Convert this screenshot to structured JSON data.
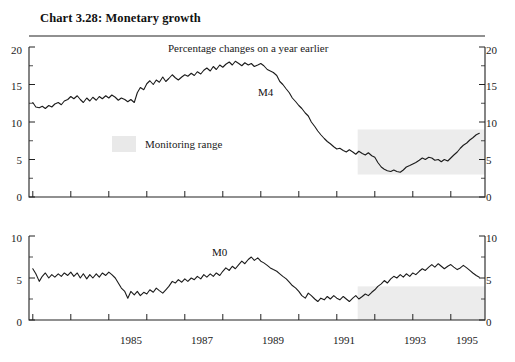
{
  "title": "Chart 3.28: Monetary growth",
  "subtitle": "Percentage changes on a year earlier",
  "legend": {
    "monitoring_range_label": "Monitoring range",
    "swatch_color": "#ececec"
  },
  "axis": {
    "x_ticks": [
      "1985",
      "1987",
      "1989",
      "1991",
      "1993",
      "1995"
    ],
    "top_y_ticks": [
      "0",
      "5",
      "10",
      "15",
      "20"
    ],
    "bottom_y_ticks": [
      "0",
      "5",
      "10"
    ]
  },
  "chart_data": [
    {
      "type": "line",
      "title": "Chart 3.28: Monetary growth",
      "subtitle": "Percentage changes on a year earlier",
      "panel": "top",
      "xlabel": "",
      "ylabel": "",
      "xlim": [
        1983.9,
        1995.9
      ],
      "ylim": [
        0,
        20
      ],
      "yticks": [
        0,
        5,
        10,
        15,
        20
      ],
      "xticks": [
        1985,
        1987,
        1989,
        1991,
        1993,
        1995
      ],
      "grid": false,
      "legend": "none",
      "annotations": [
        {
          "text": "M4",
          "x": 1989.3,
          "y": 14.2
        },
        {
          "text": "Percentage changes on a year earlier",
          "x": 1989.0,
          "y": 19.2
        },
        {
          "text": "Monitoring range",
          "x": 1987.0,
          "y": 7.6
        }
      ],
      "bands": [
        {
          "label": "Monitoring range",
          "x_start": 1992.55,
          "x_end": 1995.9,
          "y_low": 3,
          "y_high": 9,
          "color": "#ececec"
        }
      ],
      "series": [
        {
          "name": "M4",
          "x": [
            1984.0,
            1984.08,
            1984.17,
            1984.25,
            1984.33,
            1984.42,
            1984.5,
            1984.58,
            1984.67,
            1984.75,
            1984.83,
            1984.92,
            1985.0,
            1985.08,
            1985.17,
            1985.25,
            1985.33,
            1985.42,
            1985.5,
            1985.58,
            1985.67,
            1985.75,
            1985.83,
            1985.92,
            1986.0,
            1986.08,
            1986.17,
            1986.25,
            1986.33,
            1986.42,
            1986.5,
            1986.58,
            1986.67,
            1986.75,
            1986.83,
            1986.92,
            1987.0,
            1987.08,
            1987.17,
            1987.25,
            1987.33,
            1987.42,
            1987.5,
            1987.58,
            1987.67,
            1987.75,
            1987.83,
            1987.92,
            1988.0,
            1988.08,
            1988.17,
            1988.25,
            1988.33,
            1988.42,
            1988.5,
            1988.58,
            1988.67,
            1988.75,
            1988.83,
            1988.92,
            1989.0,
            1989.08,
            1989.17,
            1989.25,
            1989.33,
            1989.42,
            1989.5,
            1989.58,
            1989.67,
            1989.75,
            1989.83,
            1989.92,
            1990.0,
            1990.08,
            1990.17,
            1990.25,
            1990.33,
            1990.42,
            1990.5,
            1990.58,
            1990.67,
            1990.75,
            1990.83,
            1990.92,
            1991.0,
            1991.08,
            1991.17,
            1991.25,
            1991.33,
            1991.42,
            1991.5,
            1991.58,
            1991.67,
            1991.75,
            1991.83,
            1991.92,
            1992.0,
            1992.08,
            1992.17,
            1992.25,
            1992.33,
            1992.42,
            1992.5,
            1992.58,
            1992.67,
            1992.75,
            1992.83,
            1992.92,
            1993.0,
            1993.08,
            1993.17,
            1993.25,
            1993.33,
            1993.42,
            1993.5,
            1993.58,
            1993.67,
            1993.75,
            1993.83,
            1993.92,
            1994.0,
            1994.08,
            1994.17,
            1994.25,
            1994.33,
            1994.42,
            1994.5,
            1994.58,
            1994.67,
            1994.75,
            1994.83,
            1994.92,
            1995.0,
            1995.08,
            1995.17,
            1995.25,
            1995.33,
            1995.42,
            1995.5,
            1995.58,
            1995.67,
            1995.75
          ],
          "values": [
            12.6,
            12.0,
            11.9,
            12.1,
            11.8,
            12.2,
            12.0,
            12.4,
            12.6,
            12.3,
            12.8,
            13.0,
            13.4,
            13.1,
            13.5,
            13.0,
            12.6,
            13.2,
            12.8,
            13.3,
            12.9,
            13.4,
            13.1,
            13.5,
            13.2,
            13.6,
            13.3,
            12.9,
            13.2,
            13.0,
            12.7,
            13.0,
            12.6,
            13.9,
            14.6,
            14.3,
            15.1,
            15.5,
            15.0,
            15.6,
            15.3,
            16.0,
            15.4,
            15.8,
            16.3,
            15.9,
            15.6,
            16.0,
            16.3,
            16.1,
            16.5,
            16.2,
            16.7,
            16.4,
            16.9,
            17.2,
            16.8,
            17.4,
            17.0,
            17.6,
            17.3,
            17.7,
            18.0,
            17.6,
            18.1,
            17.8,
            17.5,
            17.9,
            17.6,
            17.8,
            17.4,
            17.6,
            17.8,
            17.5,
            17.0,
            16.8,
            16.6,
            16.2,
            15.4,
            15.0,
            14.4,
            13.9,
            13.2,
            12.7,
            12.2,
            11.8,
            11.2,
            10.8,
            10.0,
            9.4,
            8.8,
            8.3,
            7.8,
            7.4,
            7.1,
            6.7,
            6.4,
            6.5,
            6.2,
            6.0,
            6.3,
            6.0,
            5.7,
            6.1,
            5.8,
            5.6,
            5.9,
            5.5,
            5.3,
            4.6,
            4.0,
            3.7,
            3.5,
            3.4,
            3.6,
            3.4,
            3.3,
            3.6,
            4.0,
            4.2,
            4.4,
            4.6,
            4.9,
            5.2,
            5.0,
            5.3,
            5.2,
            4.9,
            5.0,
            4.7,
            5.0,
            4.8,
            5.2,
            5.6,
            6.0,
            6.5,
            6.9,
            7.2,
            7.6,
            7.9,
            8.3,
            8.5
          ]
        }
      ]
    },
    {
      "type": "line",
      "panel": "bottom",
      "xlabel": "",
      "ylabel": "",
      "xlim": [
        1983.9,
        1995.9
      ],
      "ylim": [
        0,
        10
      ],
      "yticks": [
        0,
        5,
        10
      ],
      "xticks": [
        1985,
        1987,
        1989,
        1991,
        1993,
        1995
      ],
      "grid": false,
      "legend": "none",
      "annotations": [
        {
          "text": "M0",
          "x": 1988.9,
          "y": 7.2
        }
      ],
      "bands": [
        {
          "label": "Monitoring range",
          "x_start": 1992.55,
          "x_end": 1995.9,
          "y_low": 0,
          "y_high": 4,
          "color": "#ececec"
        }
      ],
      "series": [
        {
          "name": "M0",
          "x": [
            1984.0,
            1984.08,
            1984.17,
            1984.25,
            1984.33,
            1984.42,
            1984.5,
            1984.58,
            1984.67,
            1984.75,
            1984.83,
            1984.92,
            1985.0,
            1985.08,
            1985.17,
            1985.25,
            1985.33,
            1985.42,
            1985.5,
            1985.58,
            1985.67,
            1985.75,
            1985.83,
            1985.92,
            1986.0,
            1986.08,
            1986.17,
            1986.25,
            1986.33,
            1986.42,
            1986.5,
            1986.58,
            1986.67,
            1986.75,
            1986.83,
            1986.92,
            1987.0,
            1987.08,
            1987.17,
            1987.25,
            1987.33,
            1987.42,
            1987.5,
            1987.58,
            1987.67,
            1987.75,
            1987.83,
            1987.92,
            1988.0,
            1988.08,
            1988.17,
            1988.25,
            1988.33,
            1988.42,
            1988.5,
            1988.58,
            1988.67,
            1988.75,
            1988.83,
            1988.92,
            1989.0,
            1989.08,
            1989.17,
            1989.25,
            1989.33,
            1989.42,
            1989.5,
            1989.58,
            1989.67,
            1989.75,
            1989.83,
            1989.92,
            1990.0,
            1990.08,
            1990.17,
            1990.25,
            1990.33,
            1990.42,
            1990.5,
            1990.58,
            1990.67,
            1990.75,
            1990.83,
            1990.92,
            1991.0,
            1991.08,
            1991.17,
            1991.25,
            1991.33,
            1991.42,
            1991.5,
            1991.58,
            1991.67,
            1991.75,
            1991.83,
            1991.92,
            1992.0,
            1992.08,
            1992.17,
            1992.25,
            1992.33,
            1992.42,
            1992.5,
            1992.58,
            1992.67,
            1992.75,
            1992.83,
            1992.92,
            1993.0,
            1993.08,
            1993.17,
            1993.25,
            1993.33,
            1993.42,
            1993.5,
            1993.58,
            1993.67,
            1993.75,
            1993.83,
            1993.92,
            1994.0,
            1994.08,
            1994.17,
            1994.25,
            1994.33,
            1994.42,
            1994.5,
            1994.58,
            1994.67,
            1994.75,
            1994.83,
            1994.92,
            1995.0,
            1995.08,
            1995.17,
            1995.25,
            1995.33,
            1995.42,
            1995.5,
            1995.58,
            1995.67,
            1995.75
          ],
          "values": [
            6.1,
            5.5,
            4.6,
            5.2,
            5.6,
            5.0,
            5.4,
            5.1,
            5.5,
            5.2,
            5.6,
            5.3,
            5.7,
            5.2,
            5.6,
            5.0,
            5.5,
            4.9,
            5.4,
            5.0,
            5.5,
            5.1,
            5.6,
            5.3,
            5.7,
            5.4,
            5.0,
            4.4,
            3.8,
            3.4,
            2.6,
            3.4,
            3.0,
            3.4,
            2.9,
            3.3,
            3.1,
            3.6,
            3.3,
            3.8,
            3.5,
            3.2,
            3.6,
            4.0,
            4.6,
            4.4,
            4.8,
            4.5,
            4.9,
            4.6,
            5.0,
            4.8,
            5.2,
            4.9,
            5.4,
            5.1,
            5.5,
            5.2,
            5.6,
            5.3,
            5.8,
            6.2,
            5.9,
            6.4,
            6.1,
            6.6,
            7.0,
            6.7,
            7.2,
            7.5,
            7.1,
            7.4,
            7.0,
            6.8,
            6.5,
            6.2,
            6.0,
            5.8,
            5.5,
            5.2,
            4.9,
            4.5,
            4.1,
            3.8,
            3.4,
            2.9,
            2.6,
            3.2,
            2.9,
            2.5,
            2.2,
            2.6,
            2.4,
            2.8,
            2.5,
            2.9,
            2.6,
            2.4,
            2.8,
            2.5,
            2.2,
            2.6,
            2.9,
            2.5,
            2.8,
            3.1,
            2.9,
            3.3,
            3.6,
            4.0,
            4.3,
            4.7,
            4.4,
            4.9,
            5.2,
            5.0,
            5.4,
            5.1,
            5.5,
            5.2,
            5.6,
            5.4,
            5.8,
            6.1,
            5.9,
            6.3,
            6.6,
            6.3,
            6.7,
            6.4,
            6.1,
            6.4,
            6.6,
            6.3,
            6.0,
            6.2,
            6.5,
            6.2,
            5.9,
            5.6,
            5.3,
            5.1
          ]
        }
      ]
    }
  ]
}
